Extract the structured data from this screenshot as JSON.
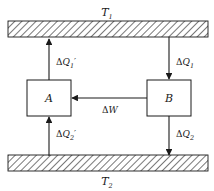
{
  "diagram": {
    "type": "thermodynamic-heat-engine-schematic",
    "reservoirs": {
      "hot": {
        "label": "T",
        "subscript": "1",
        "position": "top",
        "fill_pattern": "diagonal-hatch",
        "hatch_color": "#555555",
        "band_x": 8,
        "band_y": 21,
        "band_width": 200,
        "band_height": 16
      },
      "cold": {
        "label": "T",
        "subscript": "2",
        "position": "bottom",
        "fill_pattern": "diagonal-hatch",
        "hatch_color": "#555555",
        "band_x": 8,
        "band_y": 155,
        "band_width": 200,
        "band_height": 16
      }
    },
    "boxes": [
      {
        "id": "engine-a",
        "label": "A",
        "x": 27,
        "y": 80,
        "width": 44,
        "height": 36,
        "stroke": "#1a1a1a",
        "fill": "#ffffff"
      },
      {
        "id": "engine-b",
        "label": "B",
        "x": 147,
        "y": 80,
        "width": 44,
        "height": 36,
        "stroke": "#1a1a1a",
        "fill": "#ffffff"
      }
    ],
    "arrows": [
      {
        "id": "heat-q1-prime",
        "label_delta": "Δ",
        "label_symbol": "Q",
        "label_subscript": "1",
        "label_prime": "′",
        "direction": "up",
        "from": "engine-a",
        "to": "hot-reservoir",
        "x": 49,
        "y_start": 80,
        "y_end": 38
      },
      {
        "id": "heat-q1",
        "label_delta": "Δ",
        "label_symbol": "Q",
        "label_subscript": "1",
        "label_prime": "",
        "direction": "down",
        "from": "hot-reservoir",
        "to": "engine-b",
        "x": 169,
        "y_start": 38,
        "y_end": 80
      },
      {
        "id": "heat-q2-prime",
        "label_delta": "Δ",
        "label_symbol": "Q",
        "label_subscript": "2",
        "label_prime": "′",
        "direction": "up",
        "from": "cold-reservoir",
        "to": "engine-a",
        "x": 49,
        "y_start": 155,
        "y_end": 116
      },
      {
        "id": "heat-q2",
        "label_delta": "Δ",
        "label_symbol": "Q",
        "label_subscript": "2",
        "label_prime": "",
        "direction": "down",
        "from": "engine-b",
        "to": "cold-reservoir",
        "x": 169,
        "y_start": 116,
        "y_end": 155
      },
      {
        "id": "work-w",
        "label_delta": "Δ",
        "label_symbol": "W",
        "label_subscript": "",
        "label_prime": "",
        "direction": "left",
        "from": "engine-b",
        "to": "engine-a",
        "y": 98,
        "x_start": 147,
        "x_end": 71
      }
    ],
    "colors": {
      "stroke": "#1a1a1a",
      "text": "#1a1a1a",
      "background": "#ffffff",
      "hatch": "#555555"
    }
  }
}
